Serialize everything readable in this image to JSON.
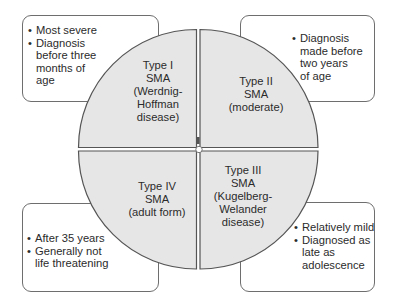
{
  "diagram": {
    "colors": {
      "circle_fill": "#e6e6e6",
      "outline": "#555555",
      "box_border": "#6e6e6e",
      "text": "#2b2b2b",
      "background": "#ffffff"
    },
    "quadrants": [
      {
        "id": "type-1",
        "position": "top-left",
        "label_lines": [
          "Type I",
          "SMA",
          "(Werdnig-",
          "Hoffman",
          "disease)"
        ],
        "note_bullets": [
          {
            "lines": [
              "Most severe"
            ]
          },
          {
            "lines": [
              "Diagnosis",
              "before three",
              "months of",
              "age"
            ]
          }
        ]
      },
      {
        "id": "type-2",
        "position": "top-right",
        "label_lines": [
          "Type II",
          "SMA",
          "(moderate)"
        ],
        "note_bullets": [
          {
            "lines": [
              "Diagnosis",
              "made before",
              "two years",
              "of age"
            ]
          }
        ]
      },
      {
        "id": "type-4",
        "position": "bottom-left",
        "label_lines": [
          "Type IV",
          "SMA",
          "(adult form)"
        ],
        "note_bullets": [
          {
            "lines": [
              "After 35 years"
            ]
          },
          {
            "lines": [
              "Generally not",
              "life threatening"
            ]
          }
        ]
      },
      {
        "id": "type-3",
        "position": "bottom-right",
        "label_lines": [
          "Type III",
          "SMA",
          "(Kugelberg-",
          "Welander",
          "disease)"
        ],
        "note_bullets": [
          {
            "lines": [
              "Relatively mild"
            ]
          },
          {
            "lines": [
              "Diagnosed as",
              "late as",
              "adolescence"
            ]
          }
        ]
      }
    ],
    "bullet_glyph": "•"
  }
}
